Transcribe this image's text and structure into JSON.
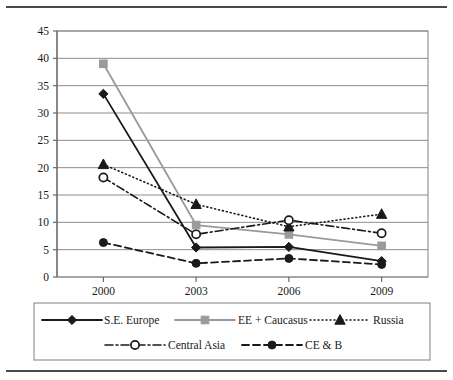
{
  "figure": {
    "top_rule": true,
    "bottom_rule": true,
    "background": "#ffffff",
    "frame_color": "#4a4a4a"
  },
  "chart_data": {
    "type": "line",
    "title": "",
    "subtitle": "",
    "xlabel": "",
    "ylabel": "",
    "categories": [
      "2000",
      "2003",
      "2006",
      "2009"
    ],
    "x": [
      2000,
      2003,
      2006,
      2009
    ],
    "ylim": [
      0,
      45
    ],
    "ytick_values": [
      0,
      5,
      10,
      15,
      20,
      25,
      30,
      35,
      40,
      45
    ],
    "ytick_labels": [
      "0",
      "5",
      "10",
      "15",
      "20",
      "25",
      "30",
      "35",
      "40",
      "45"
    ],
    "xtick_labels": [
      "2000",
      "2003",
      "2006",
      "2009"
    ],
    "grid": "horizontal",
    "legend_position": "bottom",
    "series": [
      {
        "name": "S.E. Europe",
        "values": [
          33.5,
          5.4,
          5.5,
          2.9
        ],
        "color": "#1a1a1a",
        "marker": "diamond",
        "line_style": "solid",
        "line_width": 1.8
      },
      {
        "name": "EE + Caucasus",
        "values": [
          39.0,
          9.5,
          7.8,
          5.7
        ],
        "color": "#9a9a9a",
        "marker": "square",
        "line_style": "solid",
        "line_width": 1.8
      },
      {
        "name": "Russia",
        "values": [
          20.6,
          13.3,
          9.2,
          11.5
        ],
        "color": "#1a1a1a",
        "marker": "triangle",
        "line_style": "dotted",
        "line_width": 1.6
      },
      {
        "name": "Central Asia",
        "values": [
          18.2,
          7.8,
          10.4,
          8.0
        ],
        "color": "#1a1a1a",
        "marker": "circle-open",
        "line_style": "dashdot",
        "line_width": 1.6
      },
      {
        "name": "CE & B",
        "values": [
          6.3,
          2.5,
          3.4,
          2.3
        ],
        "color": "#1a1a1a",
        "marker": "circle-filled",
        "line_style": "dashed",
        "line_width": 1.8
      }
    ]
  },
  "legend": {
    "rows": [
      [
        "S.E. Europe",
        "EE + Caucasus",
        "Russia"
      ],
      [
        "Central Asia",
        "CE & B"
      ]
    ]
  }
}
